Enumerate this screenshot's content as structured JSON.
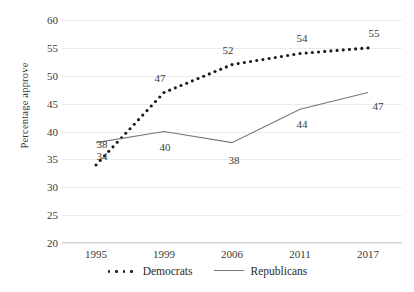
{
  "chart_data": {
    "type": "line",
    "title": "",
    "xlabel": "",
    "ylabel": "Percentage approve",
    "categories": [
      "1995",
      "1999",
      "2006",
      "2011",
      "2017"
    ],
    "ylim": [
      20,
      60
    ],
    "y_ticks": [
      "20",
      "25",
      "30",
      "35",
      "40",
      "45",
      "50",
      "55",
      "60"
    ],
    "grid": true,
    "legend_position": "bottom-center",
    "series": [
      {
        "name": "Democrats",
        "style": "dotted",
        "color": "#1a1a1a",
        "values": [
          34,
          47,
          52,
          54,
          55
        ],
        "labels": [
          "34",
          "47",
          "52",
          "54",
          "55"
        ]
      },
      {
        "name": "Republicans",
        "style": "solid",
        "color": "#777777",
        "values": [
          38,
          40,
          38,
          44,
          47
        ],
        "labels": [
          "38",
          "40",
          "38",
          "44",
          "47"
        ]
      }
    ]
  },
  "legend": {
    "items": [
      {
        "label": "Democrats",
        "marker": "dotted-line-marker"
      },
      {
        "label": "Republicans",
        "marker": "solid-line-marker"
      }
    ]
  }
}
